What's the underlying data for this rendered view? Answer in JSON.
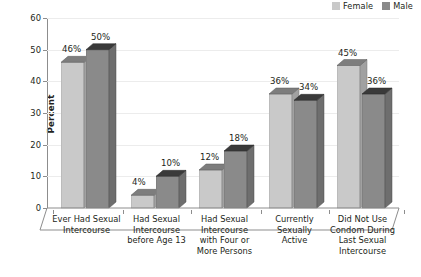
{
  "legend": {
    "entries": [
      {
        "label": "Female",
        "color": "#c9c9c9"
      },
      {
        "label": "Male",
        "color": "#8a8a8a"
      }
    ]
  },
  "axis": {
    "ylabel": "Percent",
    "yticks": [
      "0",
      "10",
      "20",
      "30",
      "40",
      "50",
      "60"
    ]
  },
  "chart_data": {
    "type": "bar",
    "title": "",
    "xlabel": "",
    "ylabel": "Percent",
    "ylim": [
      0,
      60
    ],
    "ytick_step": 10,
    "grid": true,
    "legend_position": "top-right",
    "style": "3d-grouped-column",
    "categories": [
      "Ever Had Sexual Intercourse",
      "Had Sexual Intercourse before Age 13",
      "Had Sexual Intercourse with Four or More Persons",
      "Currently Sexually Active",
      "Did Not Use Condom During Last Sexual Intercourse"
    ],
    "category_lines": [
      [
        "Ever Had Sexual",
        "Intercourse"
      ],
      [
        "Had Sexual",
        "Intercourse",
        "before Age 13"
      ],
      [
        "Had Sexual",
        "Intercourse",
        "with Four or",
        "More Persons"
      ],
      [
        "Currently",
        "Sexually",
        "Active"
      ],
      [
        "Did Not Use",
        "Condom During",
        "Last Sexual",
        "Intercourse"
      ]
    ],
    "series": [
      {
        "name": "Female",
        "color": "#c9c9c9",
        "values": [
          46,
          4,
          12,
          36,
          45
        ],
        "labels": [
          "46%",
          "4%",
          "12%",
          "36%",
          "45%"
        ]
      },
      {
        "name": "Male",
        "color": "#8a8a8a",
        "values": [
          50,
          10,
          18,
          34,
          36
        ],
        "labels": [
          "50%",
          "10%",
          "18%",
          "34%",
          "36%"
        ]
      }
    ]
  }
}
